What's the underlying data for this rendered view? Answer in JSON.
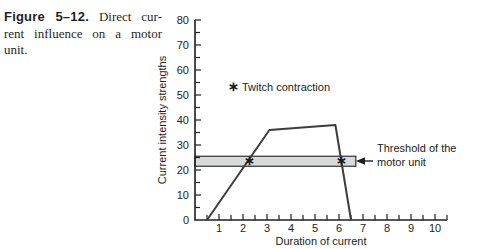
{
  "caption": {
    "label": "Figure 5–12.",
    "line1_rest": "Direct cur-",
    "line2": "rent influence on a motor",
    "line3": "unit."
  },
  "chart_data": {
    "type": "line",
    "title": "",
    "xlabel": "Duration of current",
    "ylabel": "Current intensity strengths",
    "xlim": [
      0,
      10.5
    ],
    "ylim": [
      0,
      80
    ],
    "x_major_ticks": [
      1,
      2,
      3,
      4,
      5,
      6,
      7,
      8,
      9,
      10
    ],
    "x_minor_step": 0.5,
    "y_major_ticks": [
      0,
      10,
      20,
      30,
      40,
      50,
      60,
      70,
      80
    ],
    "y_minor_step": 5,
    "series": [
      {
        "name": "direct-current-response",
        "points": [
          [
            0.5,
            0
          ],
          [
            3.1,
            36
          ],
          [
            5.85,
            38
          ],
          [
            6.5,
            0
          ]
        ]
      }
    ],
    "threshold_band": {
      "from": 21.5,
      "to": 25.5,
      "x_start": 0,
      "x_end": 6.7
    },
    "markers": [
      {
        "x": 2.25,
        "y": 23.6,
        "symbol": "∗"
      },
      {
        "x": 6.12,
        "y": 23.6,
        "symbol": "∗"
      }
    ],
    "legend": {
      "symbol": "∗",
      "label": "Twitch contraction"
    },
    "annotation": {
      "line1": "Threshold of the",
      "line2": "motor unit"
    },
    "colors": {
      "line": "#3d3d3d",
      "band_fill": "#d9dadb",
      "band_stroke": "#2f2f2f",
      "axis": "#1f1f1f",
      "text": "#1c1c1c"
    }
  }
}
